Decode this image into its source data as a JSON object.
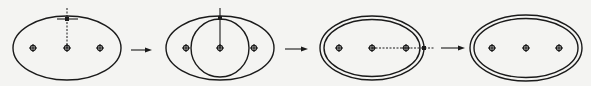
{
  "diagram": {
    "title": "",
    "background": "#f4f4f2",
    "line_color": "#1a1a1a",
    "steps": [
      {
        "id": "step-1",
        "ellipses": [
          {
            "cx": 67,
            "cy": 48,
            "rx": 54,
            "ry": 32
          }
        ],
        "circles": [],
        "center_marks": [
          {
            "x": 33,
            "y": 48
          },
          {
            "x": 67,
            "y": 48
          },
          {
            "x": 100,
            "y": 48
          }
        ],
        "guide_lines": [
          {
            "x1": 67,
            "y1": 8,
            "x2": 67,
            "y2": 48,
            "dashed": true
          },
          {
            "x1": 57,
            "y1": 19,
            "x2": 78,
            "y2": 19,
            "dashed": false
          }
        ],
        "picked_points": [
          {
            "x": 67,
            "y": 19
          }
        ]
      },
      {
        "id": "step-2",
        "ellipses": [
          {
            "cx": 220,
            "cy": 48,
            "rx": 54,
            "ry": 32
          }
        ],
        "circles": [
          {
            "cx": 220,
            "cy": 48,
            "r": 29
          }
        ],
        "center_marks": [
          {
            "x": 186,
            "y": 48
          },
          {
            "x": 220,
            "y": 48
          },
          {
            "x": 254,
            "y": 48
          }
        ],
        "guide_lines": [
          {
            "x1": 220,
            "y1": 8,
            "x2": 220,
            "y2": 48,
            "dashed": false
          }
        ],
        "picked_points": [
          {
            "x": 220,
            "y": 18
          }
        ]
      },
      {
        "id": "step-3",
        "ellipses": [
          {
            "cx": 372,
            "cy": 48,
            "rx": 52,
            "ry": 32
          },
          {
            "cx": 372,
            "cy": 48,
            "rx": 48,
            "ry": 28.5
          }
        ],
        "circles": [],
        "center_marks": [
          {
            "x": 339,
            "y": 48
          },
          {
            "x": 372,
            "y": 48
          },
          {
            "x": 406,
            "y": 48
          }
        ],
        "guide_lines": [
          {
            "x1": 372,
            "y1": 48,
            "x2": 434,
            "y2": 48,
            "dashed": true
          }
        ],
        "picked_points": [
          {
            "x": 424,
            "y": 48
          }
        ]
      },
      {
        "id": "step-4",
        "ellipses": [
          {
            "cx": 526,
            "cy": 48,
            "rx": 56,
            "ry": 33
          },
          {
            "cx": 526,
            "cy": 48,
            "rx": 52,
            "ry": 29.5
          }
        ],
        "circles": [],
        "center_marks": [
          {
            "x": 492,
            "y": 48
          },
          {
            "x": 526,
            "y": 48
          },
          {
            "x": 559,
            "y": 48
          }
        ],
        "guide_lines": [],
        "picked_points": []
      }
    ],
    "arrows": [
      {
        "x1": 131,
        "y1": 50,
        "x2": 152
      },
      {
        "x1": 285,
        "y1": 49,
        "x2": 308
      },
      {
        "x1": 441,
        "y1": 48,
        "x2": 465
      }
    ]
  }
}
